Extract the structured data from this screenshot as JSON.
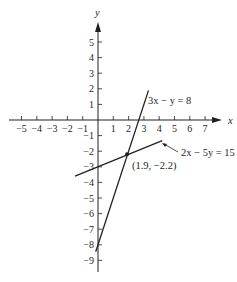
{
  "chart_data": {
    "type": "line",
    "title": "",
    "xlabel": "x",
    "ylabel": "y",
    "xlim": [
      -5.5,
      7.5
    ],
    "ylim": [
      -9.5,
      5.5
    ],
    "x_ticks": [
      -5,
      -4,
      -3,
      -2,
      -1,
      1,
      2,
      3,
      4,
      5,
      6,
      7
    ],
    "y_ticks": [
      5,
      4,
      3,
      2,
      1,
      -1,
      -2,
      -3,
      -4,
      -5,
      -6,
      -7,
      -8,
      -9
    ],
    "grid": false,
    "series": [
      {
        "name": "3x - y = 8",
        "label": "3x − y = 8",
        "slope": 3,
        "intercept": -8,
        "x_range": [
          -0.15,
          3.3
        ]
      },
      {
        "name": "2x - 5y = 15",
        "label": "2x − 5y = 15",
        "slope": 0.4,
        "intercept": -3,
        "x_range": [
          -1.5,
          4.2
        ]
      }
    ],
    "annotations": [
      {
        "text": "(1.9, −2.2)",
        "x": 1.9,
        "y": -2.2,
        "type": "intersection-point"
      }
    ]
  },
  "labels": {
    "x_axis": "x",
    "y_axis": "y",
    "line1": "3x − y = 8",
    "line2": "2x − 5y = 15",
    "point": "(1.9, −2.2)"
  }
}
